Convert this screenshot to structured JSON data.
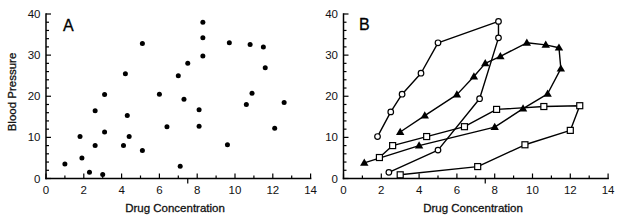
{
  "figure": {
    "panel_count": 2,
    "colors": {
      "ink": "#000000",
      "background": "#ffffff"
    }
  },
  "chart_data": [
    {
      "panel": "A",
      "type": "scatter",
      "title": "A",
      "xlabel": "Drug Concentration",
      "ylabel": "Blood Pressure",
      "xlim": [
        0,
        14
      ],
      "ylim": [
        0,
        40
      ],
      "xticks": [
        0,
        2,
        4,
        6,
        8,
        10,
        12,
        14
      ],
      "yticks": [
        0,
        10,
        20,
        30,
        40
      ],
      "x_minor_step": 1,
      "y_minor_step": 2,
      "stray_tick_x": 7.5,
      "grid": false,
      "legend": null,
      "series": [
        {
          "marker": "filled-circle",
          "connected": false,
          "color": "#000000",
          "points": [
            [
              1.0,
              3.5
            ],
            [
              1.8,
              10.2
            ],
            [
              1.9,
              5.0
            ],
            [
              2.3,
              1.5
            ],
            [
              2.6,
              16.5
            ],
            [
              2.6,
              8.0
            ],
            [
              3.0,
              1.0
            ],
            [
              3.1,
              20.4
            ],
            [
              3.1,
              11.3
            ],
            [
              4.1,
              8.0
            ],
            [
              4.2,
              25.5
            ],
            [
              4.3,
              15.3
            ],
            [
              4.4,
              10.2
            ],
            [
              5.1,
              32.8
            ],
            [
              5.1,
              6.8
            ],
            [
              6.0,
              20.5
            ],
            [
              6.4,
              12.6
            ],
            [
              7.0,
              25.0
            ],
            [
              7.1,
              3.0
            ],
            [
              7.3,
              19.3
            ],
            [
              7.5,
              28.0
            ],
            [
              8.1,
              12.7
            ],
            [
              8.1,
              16.7
            ],
            [
              8.3,
              38.0
            ],
            [
              8.3,
              34.2
            ],
            [
              8.3,
              29.8
            ],
            [
              9.6,
              8.2
            ],
            [
              9.7,
              33.0
            ],
            [
              10.6,
              18.0
            ],
            [
              10.8,
              32.6
            ],
            [
              10.9,
              20.7
            ],
            [
              11.5,
              32.0
            ],
            [
              11.6,
              26.9
            ],
            [
              12.1,
              12.2
            ],
            [
              12.6,
              18.5
            ]
          ]
        }
      ]
    },
    {
      "panel": "B",
      "type": "line",
      "title": "B",
      "xlabel": "Drug Concentration",
      "ylabel": "",
      "xlim": [
        0,
        14
      ],
      "ylim": [
        0,
        40
      ],
      "xticks": [
        0,
        2,
        4,
        6,
        8,
        10,
        12,
        14
      ],
      "yticks": [
        0,
        10,
        20,
        30,
        40
      ],
      "x_minor_step": 1,
      "y_minor_step": 2,
      "stray_tick_x": 7.5,
      "grid": false,
      "legend": null,
      "series": [
        {
          "marker": "open-circle",
          "connected": true,
          "color": "#000000",
          "points": [
            [
              1.8,
              10.2
            ],
            [
              2.5,
              16.2
            ],
            [
              3.1,
              20.5
            ],
            [
              4.1,
              25.6
            ],
            [
              5.0,
              33.0
            ],
            [
              8.2,
              38.2
            ],
            [
              8.2,
              34.2
            ],
            [
              7.2,
              19.4
            ],
            [
              5.0,
              6.9
            ],
            [
              2.4,
              1.5
            ]
          ]
        },
        {
          "marker": "filled-triangle",
          "connected": true,
          "color": "#000000",
          "points": [
            [
              3.0,
              11.3
            ],
            [
              4.3,
              15.3
            ],
            [
              6.0,
              20.4
            ],
            [
              6.9,
              24.8
            ],
            [
              7.5,
              28.0
            ],
            [
              8.3,
              29.7
            ],
            [
              9.7,
              33.0
            ],
            [
              10.7,
              32.5
            ],
            [
              11.4,
              31.8
            ],
            [
              11.5,
              26.7
            ],
            [
              10.8,
              20.6
            ],
            [
              9.5,
              17.0
            ],
            [
              8.0,
              12.5
            ],
            [
              4.0,
              8.0
            ],
            [
              1.1,
              3.8
            ]
          ]
        },
        {
          "marker": "open-square",
          "connected": true,
          "color": "#000000",
          "points": [
            [
              3.0,
              0.9
            ],
            [
              7.1,
              2.9
            ],
            [
              9.6,
              8.2
            ],
            [
              12.0,
              11.7
            ],
            [
              12.5,
              17.7
            ],
            [
              10.6,
              17.5
            ],
            [
              8.1,
              16.8
            ],
            [
              6.4,
              12.6
            ],
            [
              4.4,
              10.2
            ],
            [
              2.6,
              8.0
            ],
            [
              1.9,
              5.1
            ]
          ]
        }
      ]
    }
  ]
}
